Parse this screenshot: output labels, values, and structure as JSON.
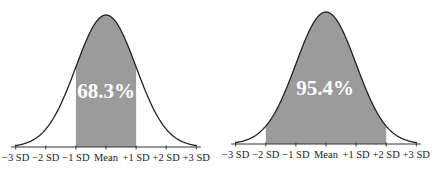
{
  "chart_data": [
    {
      "type": "area",
      "title": "",
      "description": "Normal distribution curve with area between -1 SD and +1 SD shaded",
      "xlabel": "",
      "ylabel": "",
      "categories": [
        "-3 SD",
        "-2 SD",
        "-1 SD",
        "Mean",
        "+1 SD",
        "+2 SD",
        "+3 SD"
      ],
      "x": [
        -3,
        -2,
        -1,
        0,
        1,
        2,
        3
      ],
      "shaded_range": [
        -1,
        1
      ],
      "annotation": "68.3%",
      "shaded_area_percent": 68.3,
      "grid": false,
      "legend": null
    },
    {
      "type": "area",
      "title": "",
      "description": "Normal distribution curve with area between -2 SD and +2 SD shaded",
      "xlabel": "",
      "ylabel": "",
      "categories": [
        "-3 SD",
        "-2 SD",
        "-1 SD",
        "Mean",
        "+1 SD",
        "+2 SD",
        "+3 SD"
      ],
      "x": [
        -3,
        -2,
        -1,
        0,
        1,
        2,
        3
      ],
      "shaded_range": [
        -2,
        2
      ],
      "annotation": "95.4%",
      "shaded_area_percent": 95.4,
      "grid": false,
      "legend": null
    }
  ],
  "charts": [
    {
      "id": "left",
      "axis_y": 147,
      "mean_x": 106,
      "sd_px": 30.1,
      "peak_y": 15,
      "shade_from": -1,
      "shade_to": 1,
      "label": "68.3%",
      "label_x": 106,
      "label_y": 98,
      "tick_labels": [
        "−3 SD",
        "−2 SD",
        "−1 SD",
        "Mean",
        "+1 SD",
        "+2 SD",
        "+3 SD"
      ]
    },
    {
      "id": "right",
      "axis_y": 144,
      "mean_x": 326,
      "sd_px": 30.1,
      "peak_y": 12,
      "shade_from": -2,
      "shade_to": 2,
      "label": "95.4%",
      "label_x": 325,
      "label_y": 95,
      "tick_labels": [
        "−3 SD",
        "−2 SD",
        "−1 SD",
        "Mean",
        "+1 SD",
        "+2 SD",
        "+3 SD"
      ]
    }
  ],
  "colors": {
    "shade": "#9b9b9b",
    "curve": "#222222",
    "axis": "#333333",
    "label_text": "#ffffff"
  }
}
